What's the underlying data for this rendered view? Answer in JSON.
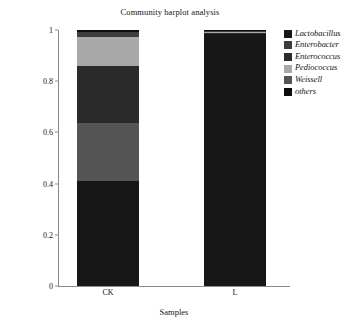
{
  "chart_data": {
    "type": "bar",
    "subtype": "stacked-bar",
    "title": "Community barplot analysis",
    "xlabel": "Samples",
    "ylabel": "Percent of community abundance on Genus level",
    "categories": [
      "CK",
      "L"
    ],
    "ylim": [
      0,
      1
    ],
    "yticks": [
      "0",
      "0.2",
      "0.4",
      "0.6",
      "0.8",
      "1"
    ],
    "ytick_values": [
      0,
      0.2,
      0.4,
      0.6,
      0.8,
      1
    ],
    "grid": false,
    "legend_position": "right",
    "stack_order_bottom_to_top": [
      "Lactobacillus",
      "Weissell",
      "Enterococcus",
      "Pediococcus",
      "Enterobacter",
      "others"
    ],
    "series": [
      {
        "name": "Lactobacillus",
        "color": "#171717",
        "values": [
          0.41,
          0.985
        ]
      },
      {
        "name": "Enterobacter",
        "color": "#3d3d3d",
        "values": [
          0.021,
          0.004
        ]
      },
      {
        "name": "Enterococcus",
        "color": "#2b2b2b",
        "values": [
          0.221,
          0.003
        ]
      },
      {
        "name": "Pediococcus",
        "color": "#a9a9a9",
        "values": [
          0.112,
          0.004
        ]
      },
      {
        "name": "Weissell",
        "color": "#555555",
        "values": [
          0.228,
          0.002
        ]
      },
      {
        "name": "others",
        "color": "#0d0d0d",
        "values": [
          0.008,
          0.002
        ]
      }
    ]
  },
  "title": {
    "text": "Community barplot analysis"
  },
  "axes": {
    "y_title": "Percent of community abundance on Genus level",
    "x_title": "Samples",
    "y_ticks": [
      {
        "label": "1",
        "value": 1
      },
      {
        "label": "0.8",
        "value": 0.8
      },
      {
        "label": "0.6",
        "value": 0.6
      },
      {
        "label": "0.4",
        "value": 0.4
      },
      {
        "label": "0.2",
        "value": 0.2
      },
      {
        "label": "0",
        "value": 0
      }
    ],
    "x_ticks": [
      {
        "label": "CK"
      },
      {
        "label": "L"
      }
    ]
  },
  "legend": {
    "items": [
      {
        "label": "Lactobacillus",
        "color": "#171717"
      },
      {
        "label": "Enterobacter",
        "color": "#3d3d3d"
      },
      {
        "label": "Enterococcus",
        "color": "#2b2b2b"
      },
      {
        "label": "Pediococcus",
        "color": "#a9a9a9"
      },
      {
        "label": "Weissell",
        "color": "#555555"
      },
      {
        "label": "others",
        "color": "#0d0d0d"
      }
    ]
  }
}
